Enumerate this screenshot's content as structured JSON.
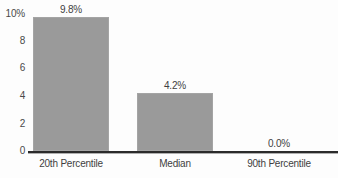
{
  "chart_data": {
    "type": "bar",
    "title": "",
    "xlabel": "",
    "ylabel": "",
    "categories": [
      "20th Percentile",
      "Median",
      "90th Percentile"
    ],
    "values": [
      9.8,
      4.2,
      0.0
    ],
    "value_labels": [
      "9.8%",
      "4.2%",
      "0.0%"
    ],
    "ylim": [
      0,
      10
    ],
    "yticks": [
      0,
      2,
      4,
      6,
      8,
      10
    ],
    "ytick_labels": [
      "0",
      "2",
      "4",
      "6",
      "8",
      "10%"
    ],
    "grid": false,
    "legend": false,
    "bar_color": "#9a9a9a",
    "axis_color": "#2b2b2b",
    "text_color": "#3f3f3f",
    "background_color": "#fdfdfd"
  },
  "axis": {
    "y_ticks": [
      {
        "label": "10%",
        "value": 10
      },
      {
        "label": "8",
        "value": 8
      },
      {
        "label": "6",
        "value": 6
      },
      {
        "label": "4",
        "value": 4
      },
      {
        "label": "2",
        "value": 2
      },
      {
        "label": "0",
        "value": 0
      }
    ]
  },
  "bars": [
    {
      "category": "20th Percentile",
      "value": 9.8,
      "label": "9.8%"
    },
    {
      "category": "Median",
      "value": 4.2,
      "label": "4.2%"
    },
    {
      "category": "90th Percentile",
      "value": 0.0,
      "label": "0.0%"
    }
  ]
}
